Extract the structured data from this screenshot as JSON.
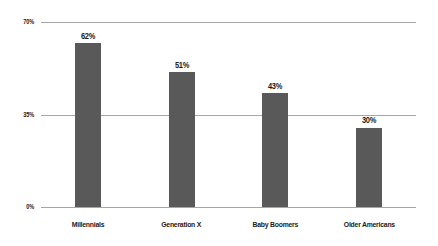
{
  "chart_data": {
    "type": "bar",
    "title": "",
    "xlabel": "",
    "ylabel": "",
    "categories": [
      "Millennials",
      "Generation X",
      "Baby Boomers",
      "Older Americans"
    ],
    "values": [
      62,
      51,
      43,
      30
    ],
    "value_labels": [
      "62%",
      "43%",
      "51%",
      "30%"
    ],
    "ylim": [
      0,
      70
    ],
    "yticks": [
      0,
      35,
      70
    ],
    "ytick_labels": [
      "0%",
      "35%",
      "70%"
    ],
    "grid": true,
    "legend": false,
    "bars": [
      {
        "category": "Millennials",
        "value": 62,
        "label": "62%"
      },
      {
        "category": "Generation X",
        "value": 51,
        "label": "51%"
      },
      {
        "category": "Baby Boomers",
        "value": 43,
        "label": "43%"
      },
      {
        "category": "Older Americans",
        "value": 30,
        "label": "30%"
      }
    ],
    "colors": {
      "bar": "#595959",
      "gridline": "#a6a6a6",
      "axis": "#a6a6a6",
      "text": "#1a1a1a",
      "background": "#ffffff"
    }
  }
}
